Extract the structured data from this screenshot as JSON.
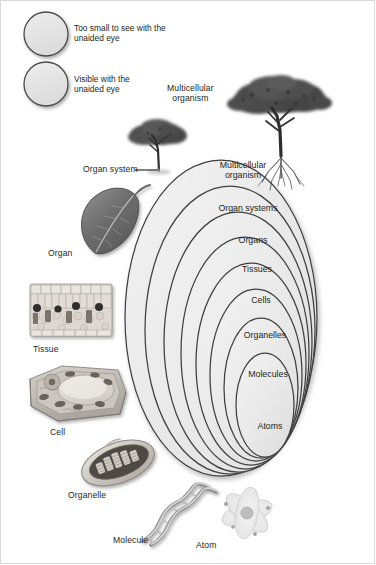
{
  "figure": {
    "background_color": "#ffffff",
    "ink_color": "#231f20",
    "oval_fill": "#e9e9e9",
    "oval_stroke": "#3f3f3f"
  },
  "legend": {
    "items": [
      {
        "icon": "circle-swatch",
        "label": "Too small to see with the\nunaided eye",
        "fill": "#e4e4e4",
        "stroke": "#4a4a4a"
      },
      {
        "icon": "circle-swatch",
        "label": "Visible with the\nunaided eye",
        "fill": "#e4e4e4",
        "stroke": "#4a4a4a"
      }
    ]
  },
  "nested_ovals": [
    {
      "label": "Multicellular\norganism",
      "level": 1
    },
    {
      "label": "Organ systems",
      "level": 2
    },
    {
      "label": "Organs",
      "level": 3
    },
    {
      "label": "Tissues",
      "level": 4
    },
    {
      "label": "Cells",
      "level": 5
    },
    {
      "label": "Organelles",
      "level": 6
    },
    {
      "label": "Molecules",
      "level": 7
    },
    {
      "label": "Atoms",
      "level": 8
    }
  ],
  "specimens": [
    {
      "label": "Multicellular\norganism",
      "icon": "tree-with-roots-icon"
    },
    {
      "label": "Organ system",
      "icon": "small-tree-icon",
      "has_leader_line": true
    },
    {
      "label": "Organ",
      "icon": "leaf-icon"
    },
    {
      "label": "Tissue",
      "icon": "leaf-cross-section-icon"
    },
    {
      "label": "Cell",
      "icon": "plant-cell-icon"
    },
    {
      "label": "Organelle",
      "icon": "chloroplast-icon"
    },
    {
      "label": "Molecule",
      "icon": "dna-helix-icon"
    },
    {
      "label": "Atom",
      "icon": "atom-icon"
    }
  ]
}
